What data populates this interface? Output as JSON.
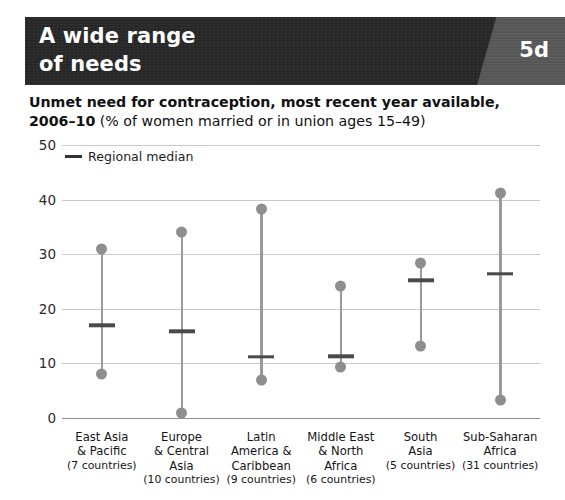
{
  "banner": {
    "title": "A wide range\nof needs",
    "badge": "5d",
    "dark_color": "#262626",
    "badge_panel_color": "#565656"
  },
  "subtitle": {
    "bold_line1": "Unmet need for contraception, most recent year available,",
    "bold_line2": "2006–10",
    "regular_line2": " (% of women married or in union ages 15–49)"
  },
  "legend": {
    "median_label": "Regional median",
    "swatch_color": "#333333"
  },
  "colors": {
    "dot": "#8e8e8e",
    "line": "#9a9a9a",
    "median": "#4a4a4a",
    "grid": "#c9c9c9",
    "axis": "#8d8d8d"
  },
  "chart_data": {
    "type": "range",
    "title": "A wide range of needs",
    "subtitle": "Unmet need for contraception, most recent year available, 2006–10 (% of women married or in union ages 15–49)",
    "xlabel": "",
    "ylabel": "",
    "ylim": [
      0,
      50
    ],
    "yticks": [
      0,
      10,
      20,
      30,
      40,
      50
    ],
    "grid": true,
    "legend_position": "top-left",
    "legend_entries": [
      "Regional median"
    ],
    "categories": [
      "East Asia & Pacific",
      "Europe & Central Asia",
      "Latin America & Caribbean",
      "Middle East & North Africa",
      "South Asia",
      "Sub-Saharan Africa"
    ],
    "category_lines": [
      [
        "East Asia",
        "& Pacific"
      ],
      [
        "Europe",
        "& Central",
        "Asia"
      ],
      [
        "Latin",
        "America &",
        "Caribbean"
      ],
      [
        "Middle East",
        "& North",
        "Africa"
      ],
      [
        "South",
        "Asia"
      ],
      [
        "Sub-Saharan",
        "Africa"
      ]
    ],
    "country_counts": [
      "(7 countries)",
      "(10 countries)",
      "(9 countries)",
      "(6 countries)",
      "(5 countries)",
      "(31 countries)"
    ],
    "series": [
      {
        "name": "Maximum",
        "values": [
          31.0,
          34.0,
          38.2,
          24.1,
          28.3,
          41.2
        ]
      },
      {
        "name": "Regional median",
        "values": [
          17.0,
          15.9,
          11.2,
          11.3,
          25.2,
          26.4
        ]
      },
      {
        "name": "Minimum",
        "values": [
          8.0,
          1.0,
          7.0,
          9.3,
          13.2,
          3.3
        ]
      }
    ]
  }
}
